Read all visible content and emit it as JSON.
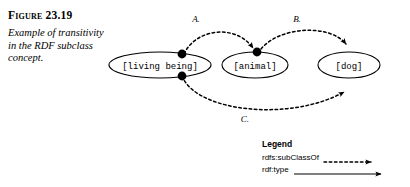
{
  "figure": {
    "number_label": "Figure 23.19",
    "caption": "Example of transitivity in the RDF subclass concept."
  },
  "diagram": {
    "nodes": [
      {
        "id": "living-being",
        "label": "[living being]"
      },
      {
        "id": "animal",
        "label": "[animal]"
      },
      {
        "id": "dog",
        "label": "[dog]"
      }
    ],
    "edges": [
      {
        "id": "a",
        "label": "A.",
        "from": "living-being",
        "to": "animal",
        "style": "dashed",
        "relation": "rdfs:subClassOf"
      },
      {
        "id": "b",
        "label": "B.",
        "from": "animal",
        "to": "dog",
        "style": "dashed",
        "relation": "rdfs:subClassOf"
      },
      {
        "id": "c",
        "label": "C.",
        "from": "living-being",
        "to": "dog",
        "style": "dashed",
        "relation": "rdfs:subClassOf"
      }
    ]
  },
  "legend": {
    "title": "Legend",
    "items": [
      {
        "label": "rdfs:subClassOf",
        "style": "dashed-arrow"
      },
      {
        "label": "rdf:type",
        "style": "solid-arrow"
      }
    ]
  },
  "colors": {
    "ink": "#000000",
    "background": "#ffffff"
  }
}
